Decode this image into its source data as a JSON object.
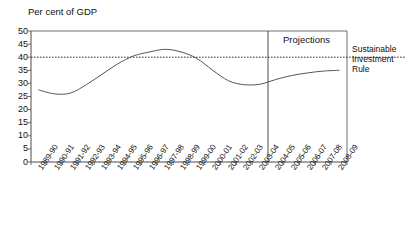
{
  "chart_data": {
    "type": "line",
    "title": "Per cent of GDP",
    "xlabel": "",
    "ylabel": "Per cent of GDP",
    "ylim": [
      0,
      50
    ],
    "ytick_step": 5,
    "yticks": [
      50,
      45,
      40,
      35,
      30,
      25,
      20,
      15,
      10,
      5,
      0
    ],
    "grid": false,
    "legend_position": "right-annotation",
    "categories": [
      "1989-90",
      "1990-91",
      "1991-92",
      "1992-93",
      "1993-94",
      "1994-95",
      "1995-96",
      "1996-97",
      "1997-98",
      "1998-99",
      "1999-00",
      "2000-01",
      "2001-02",
      "2002-03",
      "2003-04",
      "2004-05",
      "2005-06",
      "2006-07",
      "2007-08",
      "2008-09"
    ],
    "series": [
      {
        "name": "Public sector net debt",
        "values": [
          27.5,
          26.0,
          26.3,
          29.5,
          33.5,
          37.5,
          40.5,
          42.0,
          43.0,
          42.0,
          39.5,
          35.0,
          31.0,
          29.5,
          29.7,
          31.5,
          33.0,
          34.0,
          34.7,
          35.0
        ]
      }
    ],
    "reference_line": {
      "label": "Sustainable Investment Rule",
      "value": 40,
      "style": "dashed"
    },
    "projection_divider": {
      "label": "Projections",
      "start_category": "2004-05"
    }
  },
  "annotations": {
    "projections": "Projections",
    "sustainable_investment_rule_line1": "Sustainable",
    "sustainable_investment_rule_line2": "Investment",
    "sustainable_investment_rule_line3": "Rule"
  },
  "colors": {
    "line": "#555555",
    "axis": "#4d4d4d",
    "reference": "#333333",
    "background": "#ffffff"
  }
}
